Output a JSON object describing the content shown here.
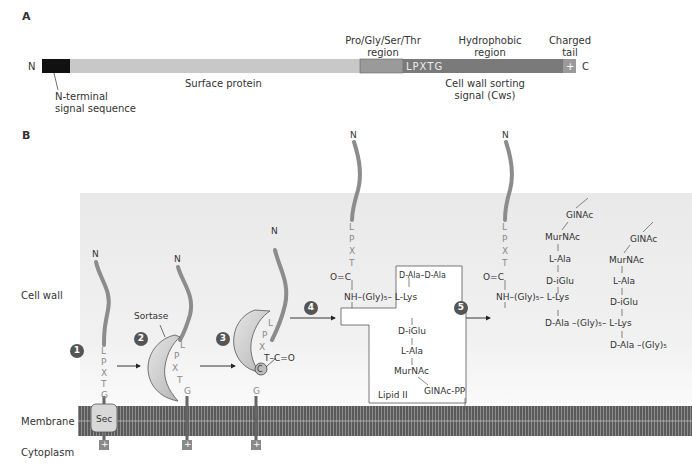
{
  "panelA": {
    "label": "A",
    "n_terminus": "N",
    "c_terminus": "C",
    "segments": {
      "signal": "N-terminal signal sequence",
      "surface": "Surface protein",
      "pgst_line1": "Pro/Gly/Ser/Thr",
      "pgst_line2": "region",
      "hydro_line1": "Hydrophobic",
      "hydro_line2": "region",
      "charged_line1": "Charged",
      "charged_line2": "tail",
      "motif": "LPXTG",
      "plus": "+",
      "cws_line1": "Cell wall sorting",
      "cws_line2": "signal (Cws)"
    },
    "signal_line1": "N-terminal",
    "signal_line2": "signal sequence"
  },
  "panelB": {
    "label": "B",
    "regions": {
      "cell_wall": "Cell wall",
      "membrane": "Membrane",
      "cytoplasm": "Cytoplasm"
    },
    "steps": [
      "1",
      "2",
      "3",
      "4",
      "5"
    ],
    "sec": "Sec",
    "sortase": "Sortase",
    "n": "N",
    "residues": [
      "L",
      "P",
      "X",
      "T",
      "G"
    ],
    "plus": "+",
    "step3": {
      "carbonyl": "T–C=O",
      "cys": "C"
    },
    "step4": {
      "oc": "O=C",
      "nh_gly_lys": "NH–(Gly)₅– L-Lys",
      "dala_dala": "D-Ala–D-Ala",
      "diglu": "D-iGlu",
      "lala": "L-Ala",
      "murnac": "MurNAc",
      "glnac_pp": "GlNAc-PP",
      "lipid2": "Lipid II"
    },
    "step5": {
      "oc": "O=C",
      "nh_gly_lys": "NH–(Gly)₅– L-Lys",
      "glnac": "GlNAc",
      "murnac": "MurNAc",
      "lala": "L-Ala",
      "diglu": "D-iGlu",
      "dala_gly_lys": "D-Ala –(Gly)₅– L-Lys",
      "glnac2": "GlNAc",
      "murnac2": "MurNAc",
      "lala2": "L-Ala",
      "diglu2": "D-iGlu",
      "dala_gly": "D-Ala –(Gly)₅"
    }
  },
  "colors": {
    "signal": "#111111",
    "surface": "#c8c8c8",
    "pgst": "#9a9a9a",
    "cws": "#7a7a7a",
    "chain": "#8c8c8c",
    "cellwall_bg": "#ececec",
    "membrane": "#555555",
    "sortase": "#cfcfcf",
    "badge": "#555555"
  }
}
